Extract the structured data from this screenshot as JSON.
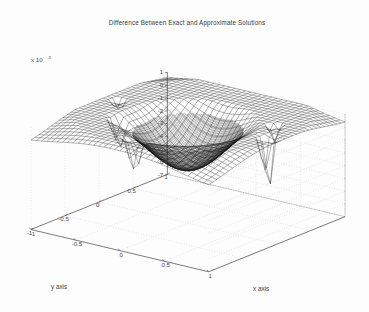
{
  "figure": {
    "title": "Difference Between Exact and Approximate Solutions",
    "background_color": "#fdfdfd",
    "mesh_color": "#1a1a1a",
    "axis_color": "#555555",
    "grid_color": "#b9b9b9"
  },
  "axes": {
    "z": {
      "exponent_label": "x 10",
      "exponent_power": "-3",
      "ticks": [
        "1",
        "0",
        "-1",
        "-2",
        "-3",
        "-4",
        "-5",
        "-6",
        "-7"
      ],
      "range": [
        -7,
        1
      ]
    },
    "y": {
      "label": "y axis",
      "ticks": [
        "1",
        "0.5",
        "0",
        "-0.5",
        "-1"
      ],
      "range": [
        -1,
        1
      ]
    },
    "x": {
      "label": "x axis",
      "ticks": [
        "-1",
        "-0.5",
        "0",
        "0.5",
        "1"
      ],
      "range": [
        -1,
        1
      ]
    }
  },
  "chart_data": {
    "type": "line",
    "title": "Difference Between Exact and Approximate Solutions",
    "xlabel": "x axis",
    "ylabel": "y axis",
    "zlabel": "x 10^-3",
    "plot_style": "3d-wireframe-mesh",
    "xlim": [
      -1,
      1
    ],
    "ylim": [
      -1,
      1
    ],
    "zlim": [
      -7,
      1
    ],
    "z_scale_exponent": -3,
    "grid": true,
    "legend": null,
    "mesh_rows": 34,
    "mesh_cols": 34,
    "view_azimuth": -37.5,
    "view_elevation": 30,
    "surface_features": [
      {
        "name": "central-basin",
        "x": 0.05,
        "y": 0.0,
        "z": -3.0
      },
      {
        "name": "back-peak",
        "x": -0.15,
        "y": 0.75,
        "z": 1.0
      },
      {
        "name": "secondary-peak",
        "x": 0.35,
        "y": 0.6,
        "z": 0.55
      },
      {
        "name": "spike-front-left",
        "x": -0.55,
        "y": -0.3,
        "z": -4.6
      },
      {
        "name": "spike-front-center",
        "x": -0.1,
        "y": -0.65,
        "z": -5.1
      },
      {
        "name": "spike-right",
        "x": 0.85,
        "y": 0.05,
        "z": -6.9
      },
      {
        "name": "spike-right-upper",
        "x": 0.72,
        "y": 0.35,
        "z": -2.4
      }
    ],
    "x_tick_values": [
      -1,
      -0.5,
      0,
      0.5,
      1
    ],
    "y_tick_values": [
      1,
      0.5,
      0,
      -0.5,
      -1
    ],
    "z_tick_values": [
      1,
      0,
      -1,
      -2,
      -3,
      -4,
      -5,
      -6,
      -7
    ]
  }
}
